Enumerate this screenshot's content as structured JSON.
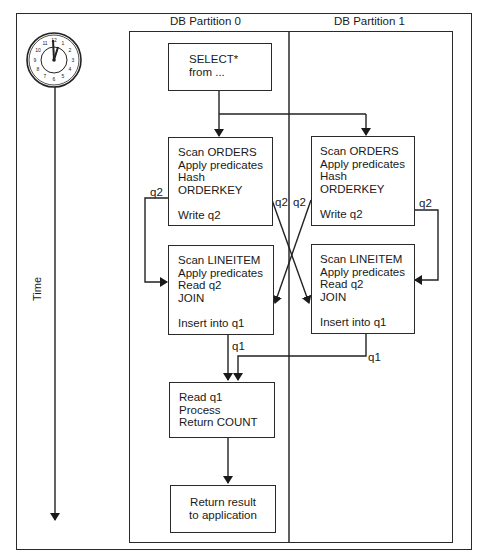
{
  "diagram": {
    "time_axis": {
      "label": "Time",
      "icon": "clock-icon"
    },
    "partitions": [
      {
        "label": "DB Partition 0"
      },
      {
        "label": "DB Partition 1"
      }
    ],
    "nodes": {
      "select": {
        "text": "SELECT*\nfrom ..."
      },
      "orders_p0": {
        "text": "Scan ORDERS\nApply predicates\nHash\nORDERKEY\n\nWrite q2"
      },
      "orders_p1": {
        "text": "Scan ORDERS\nApply predicates\nHash\nORDERKEY\n\nWrite q2"
      },
      "lineitem_p0": {
        "text": "Scan LINEITEM\nApply predicates\nRead q2\nJOIN\n\nInsert into q1"
      },
      "lineitem_p1": {
        "text": "Scan LINEITEM\nApply predicates\nRead q2\nJOIN\n\nInsert into q1"
      },
      "read_q1": {
        "text": "Read q1\nProcess\nReturn COUNT"
      },
      "return_result": {
        "text": "Return result\nto application"
      }
    },
    "edge_labels": {
      "q2_left": "q2",
      "q2_cross_left": "q2",
      "q2_cross_right": "q2",
      "q2_right": "q2",
      "q1_p0": "q1",
      "q1_p1": "q1"
    },
    "edges": [
      {
        "from": "select",
        "to": "orders_p0"
      },
      {
        "from": "select",
        "to": "orders_p1"
      },
      {
        "from": "orders_p0",
        "to": "lineitem_p0",
        "label": "q2"
      },
      {
        "from": "orders_p0",
        "to": "lineitem_p1",
        "label": "q2"
      },
      {
        "from": "orders_p1",
        "to": "lineitem_p0",
        "label": "q2"
      },
      {
        "from": "orders_p1",
        "to": "lineitem_p1",
        "label": "q2"
      },
      {
        "from": "lineitem_p0",
        "to": "read_q1",
        "label": "q1"
      },
      {
        "from": "lineitem_p1",
        "to": "read_q1",
        "label": "q1"
      },
      {
        "from": "read_q1",
        "to": "return_result"
      }
    ]
  }
}
